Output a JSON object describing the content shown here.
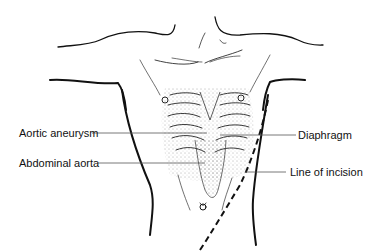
{
  "diagram": {
    "labels": {
      "aortic_aneurysm": "Aortic aneurysm",
      "abdominal_aorta": "Abdominal aorta",
      "diaphragm": "Diaphragm",
      "line_of_incision": "Line of incision"
    },
    "colors": {
      "ink": "#111111",
      "leader": "#555555",
      "background": "#ffffff"
    }
  }
}
